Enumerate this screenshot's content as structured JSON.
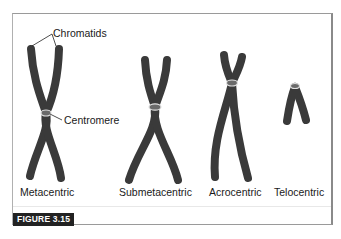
{
  "figure": {
    "caption": "FIGURE 3.15",
    "annotations": {
      "chromatids": "Chromatids",
      "centromere": "Centromere"
    },
    "chromosomes": [
      {
        "type": "metacentric",
        "label": "Metacentric"
      },
      {
        "type": "submetacentric",
        "label": "Submetacentric"
      },
      {
        "type": "acrocentric",
        "label": "Acrocentric"
      },
      {
        "type": "telocentric",
        "label": "Telocentric"
      }
    ],
    "colors": {
      "chromosome": "#3a3a3a",
      "centromere_outline": "#d8d8d8",
      "frame": "#9a9a9a",
      "caption_bg": "#222222",
      "caption_text": "#ffffff"
    }
  }
}
